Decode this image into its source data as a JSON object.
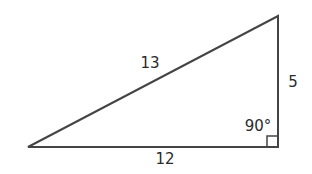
{
  "diagram": {
    "type": "right-triangle",
    "vertices": {
      "left": [
        28,
        147
      ],
      "top_right": [
        278,
        16
      ],
      "right_angle": [
        278,
        147
      ]
    },
    "labels": {
      "hypotenuse": "13",
      "vertical_leg": "5",
      "horizontal_leg": "12",
      "right_angle": "90°"
    },
    "stroke_color": "#444444",
    "text_color": "#2b2b2b"
  }
}
